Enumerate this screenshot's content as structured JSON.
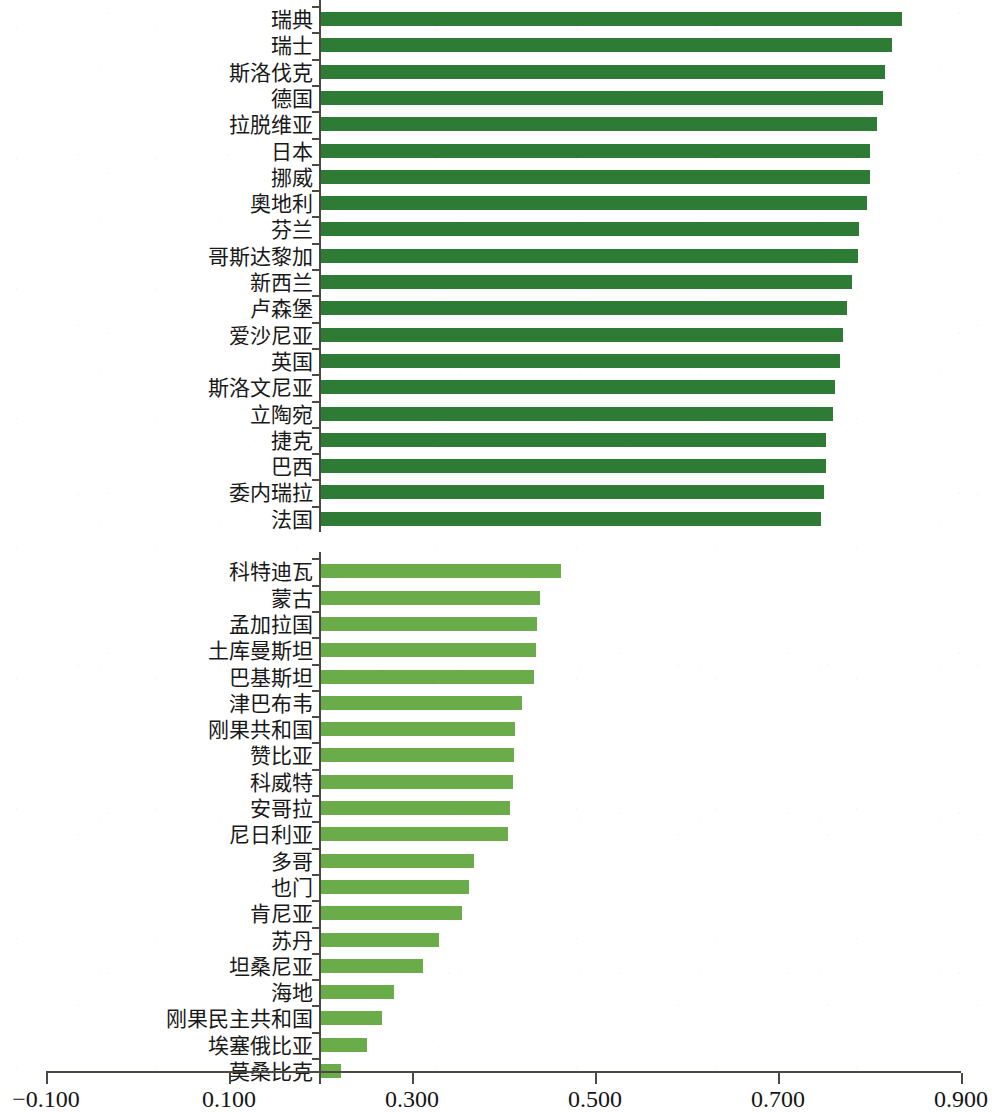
{
  "chart_data": {
    "type": "bar",
    "orientation": "horizontal",
    "title": "",
    "subtitle": "",
    "xlabel": "",
    "ylabel": "",
    "xlim": [
      -0.1,
      0.9
    ],
    "xticks": [
      -0.1,
      0.1,
      0.3,
      0.5,
      0.7,
      0.9
    ],
    "xtick_labels": [
      "−0.100",
      "0.100",
      "0.300",
      "0.500",
      "0.700",
      "0.900"
    ],
    "bar_baseline": 0.2,
    "grid": false,
    "legend": "none",
    "series": [
      {
        "name": "top-group",
        "color": "#2d7b34",
        "categories": [
          "瑞典",
          "瑞士",
          "斯洛伐克",
          "德国",
          "拉脱维亚",
          "日本",
          "挪威",
          "奧地利",
          "芬兰",
          "哥斯达黎加",
          "新西兰",
          "卢森堡",
          "爱沙尼亚",
          "英国",
          "斯洛文尼亚",
          "立陶宛",
          "捷克",
          "巴西",
          "委内瑞拉",
          "法国"
        ],
        "values": [
          0.835,
          0.825,
          0.817,
          0.815,
          0.808,
          0.8,
          0.8,
          0.797,
          0.789,
          0.787,
          0.781,
          0.775,
          0.771,
          0.768,
          0.762,
          0.76,
          0.753,
          0.752,
          0.75,
          0.747
        ]
      },
      {
        "name": "bottom-group",
        "color": "#6aab4a",
        "categories": [
          "科特迪瓦",
          "蒙古",
          "孟加拉国",
          "土库曼斯坦",
          "巴基斯坦",
          "津巴布韦",
          "刚果共和国",
          "赞比亚",
          "科威特",
          "安哥拉",
          "尼日利亚",
          "多哥",
          "也门",
          "肯尼亚",
          "苏丹",
          "坦桑尼亚",
          "海地",
          "刚果民主共和国",
          "埃塞俄比亚",
          "莫桑比克"
        ],
        "values": [
          0.463,
          0.44,
          0.437,
          0.435,
          0.433,
          0.42,
          0.413,
          0.412,
          0.41,
          0.407,
          0.405,
          0.368,
          0.362,
          0.355,
          0.33,
          0.312,
          0.28,
          0.267,
          0.251,
          0.222
        ]
      }
    ]
  }
}
